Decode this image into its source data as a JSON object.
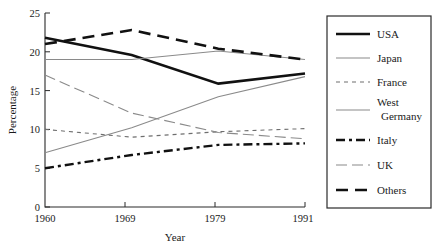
{
  "chart_data": {
    "type": "line",
    "title": "",
    "xlabel": "Year",
    "ylabel": "Percentage",
    "x": [
      "1960",
      "1969",
      "1979",
      "1991"
    ],
    "categories": [
      "1960",
      "1969",
      "1979",
      "1991"
    ],
    "xtick_labels": [
      "1960",
      "1969",
      "1979",
      "1991"
    ],
    "ytick_labels": [
      "0",
      "5",
      "10",
      "15",
      "20",
      "25"
    ],
    "ytick_values": [
      0,
      5,
      10,
      15,
      20,
      25
    ],
    "ylim": [
      0,
      25
    ],
    "grid": false,
    "legend_position": "right",
    "series": [
      {
        "name": "USA",
        "values": [
          21.8,
          19.6,
          15.9,
          17.2
        ]
      },
      {
        "name": "Japan",
        "values": [
          7.0,
          10.2,
          14.2,
          16.8
        ]
      },
      {
        "name": "France",
        "values": [
          10.0,
          9.0,
          9.7,
          10.1
        ]
      },
      {
        "name": "West Germany",
        "values": [
          19.0,
          19.0,
          20.1,
          19.0
        ]
      },
      {
        "name": "Italy",
        "values": [
          5.0,
          6.7,
          8.0,
          8.2
        ]
      },
      {
        "name": "UK",
        "values": [
          17.0,
          12.1,
          9.6,
          8.8
        ]
      },
      {
        "name": "Others",
        "values": [
          21.0,
          22.8,
          20.4,
          19.0
        ]
      }
    ]
  },
  "legend": {
    "entries": [
      {
        "label": "USA"
      },
      {
        "label": "Japan"
      },
      {
        "label": "France"
      },
      {
        "label": "West"
      },
      {
        "label": "Germany"
      },
      {
        "label": "Italy"
      },
      {
        "label": "UK"
      },
      {
        "label": "Others"
      }
    ]
  },
  "axes": {
    "y_label": "Percentage",
    "x_label": "Year",
    "y_ticks": [
      "25",
      "20",
      "15",
      "10",
      "5",
      "0"
    ],
    "x_ticks": [
      "1960",
      "1969",
      "1979",
      "1991"
    ]
  }
}
